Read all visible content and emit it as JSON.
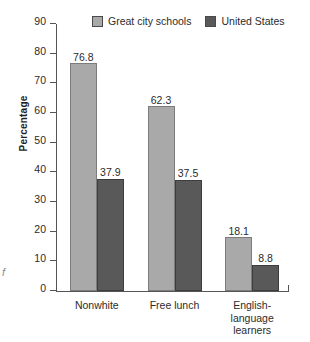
{
  "artifact": {
    "mark": "f"
  },
  "chart_data": {
    "type": "bar",
    "title": "",
    "xlabel": "",
    "ylabel": "Percentage",
    "ylim": [
      0,
      90
    ],
    "yticks": [
      0,
      10,
      20,
      30,
      40,
      50,
      60,
      70,
      80,
      90
    ],
    "ytick_labels": [
      "0",
      "10",
      "20",
      "30",
      "40",
      "50",
      "60",
      "70",
      "80",
      "90"
    ],
    "grid": false,
    "legend_position": "top",
    "categories": [
      "Nonwhite",
      "Free lunch",
      "English-language learners"
    ],
    "category_label_lines": [
      [
        "Nonwhite"
      ],
      [
        "Free lunch"
      ],
      [
        "English-",
        "language",
        "learners"
      ]
    ],
    "series": [
      {
        "name": "Great city schools",
        "color": "#a9a9a9",
        "values": [
          76.8,
          62.3,
          18.1
        ],
        "value_labels": [
          "76.8",
          "62.3",
          "18.1"
        ]
      },
      {
        "name": "United States",
        "color": "#595959",
        "values": [
          37.9,
          37.5,
          8.8
        ],
        "value_labels": [
          "37.9",
          "37.5",
          "8.8"
        ]
      }
    ]
  }
}
